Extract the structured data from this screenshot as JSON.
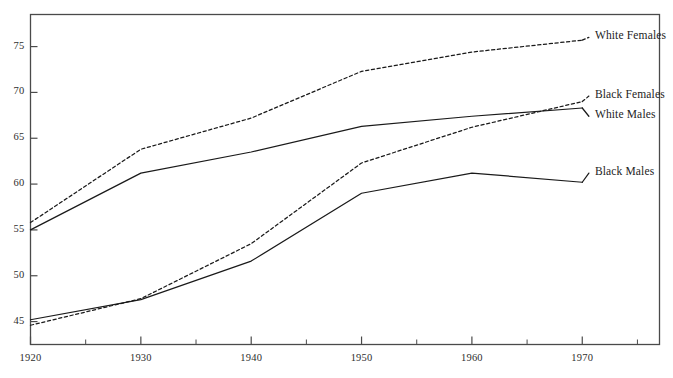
{
  "chart_data": {
    "type": "line",
    "title": "",
    "subtitle": "",
    "xlabel": "",
    "ylabel": "",
    "x": [
      1920,
      1930,
      1940,
      1950,
      1960,
      1970
    ],
    "xlim": [
      1920,
      1977
    ],
    "ylim": [
      42.5,
      78.5
    ],
    "xticks": [
      1920,
      1930,
      1940,
      1950,
      1960,
      1970
    ],
    "xtick_labels": [
      "1920",
      "1930",
      "1940",
      "1950",
      "1960",
      "1970"
    ],
    "x_minor_ticks": [
      1925,
      1935,
      1945,
      1955,
      1965,
      1975
    ],
    "yticks": [
      45,
      50,
      55,
      60,
      65,
      70,
      75
    ],
    "ytick_labels": [
      "45",
      "50",
      "55",
      "60",
      "65",
      "70",
      "75"
    ],
    "grid": false,
    "legend_position": "right-inline",
    "frame": true,
    "series": [
      {
        "name": "White Females",
        "style": "dashed",
        "color": "#1a1a1a",
        "values": [
          55.8,
          63.8,
          67.2,
          72.3,
          74.4,
          75.7
        ],
        "label_x": 1970.6,
        "label_y": 76.0
      },
      {
        "name": "Black Females",
        "style": "dashed",
        "color": "#1a1a1a",
        "values": [
          44.6,
          47.5,
          53.5,
          62.3,
          66.2,
          69.0
        ],
        "label_x": 1970.6,
        "label_y": 69.6
      },
      {
        "name": "White Males",
        "style": "solid",
        "color": "#1a1a1a",
        "values": [
          55.0,
          61.2,
          63.5,
          66.3,
          67.4,
          68.3
        ],
        "label_x": 1970.6,
        "label_y": 67.4
      },
      {
        "name": "Black Males",
        "style": "solid",
        "color": "#1a1a1a",
        "values": [
          45.2,
          47.4,
          51.6,
          59.0,
          61.2,
          60.2
        ],
        "label_x": 1970.6,
        "label_y": 61.2
      }
    ]
  },
  "plot": {
    "frame_color": "#4a4a4a",
    "line_color": "#1a1a1a",
    "background": "#ffffff"
  }
}
